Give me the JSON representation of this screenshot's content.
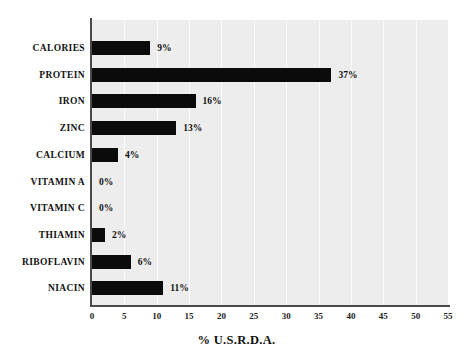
{
  "chart_data": {
    "type": "bar",
    "orientation": "horizontal",
    "title": "",
    "xlabel": "% U.S.R.D.A.",
    "ylabel": "",
    "xlim": [
      0,
      55
    ],
    "xticks": [
      "0",
      "5",
      "10",
      "15",
      "20",
      "25",
      "30",
      "35",
      "40",
      "45",
      "50",
      "55"
    ],
    "grid": true,
    "legend": "none",
    "categories": [
      "CALORIES",
      "PROTEIN",
      "IRON",
      "ZINC",
      "CALCIUM",
      "VITAMIN A",
      "VITAMIN C",
      "THIAMIN",
      "RIBOFLAVIN",
      "NIACIN"
    ],
    "values": [
      9,
      37,
      16,
      13,
      4,
      0,
      0,
      2,
      6,
      11
    ],
    "value_labels": [
      "9%",
      "37%",
      "16%",
      "13%",
      "4%",
      "0%",
      "0%",
      "2%",
      "6%",
      "11%"
    ],
    "bar_color": "#0b0b0b",
    "plot_background": "#ededed",
    "page_background": "#ffffff",
    "axis_color": "#4a4a4a",
    "gridline_color": "#fbfbfb"
  }
}
